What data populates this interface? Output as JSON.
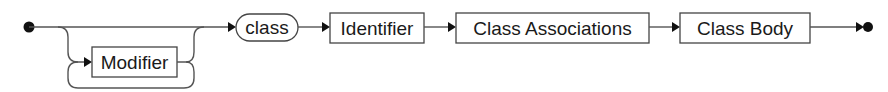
{
  "diagram": {
    "type": "railroad-syntax-diagram",
    "colors": {
      "line": "#555555",
      "box_border": "#444444",
      "text": "#1a1a1a",
      "background": "#ffffff"
    },
    "optional_loop": {
      "nonterminal": "Modifier",
      "repeatable": true,
      "skippable": true
    },
    "sequence": [
      {
        "kind": "terminal",
        "label": "class"
      },
      {
        "kind": "nonterminal",
        "label": "Identifier"
      },
      {
        "kind": "nonterminal",
        "label": "Class Associations"
      },
      {
        "kind": "nonterminal",
        "label": "Class Body"
      }
    ],
    "start_marker": "filled-circle",
    "end_marker": "arrow-to-filled-circle"
  }
}
